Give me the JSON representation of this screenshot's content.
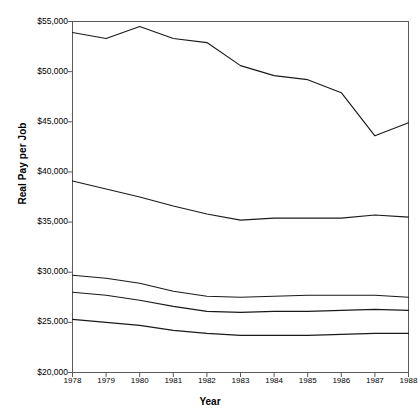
{
  "chart_data": {
    "type": "line",
    "title": "",
    "xlabel": "Year",
    "ylabel": "Real Pay per Job",
    "x": [
      1978,
      1979,
      1980,
      1981,
      1982,
      1983,
      1984,
      1985,
      1986,
      1987,
      1988
    ],
    "xtick_labels": [
      "1978",
      "1979",
      "1980",
      "1981",
      "1982",
      "1983",
      "1984",
      "1985",
      "1986",
      "1987",
      "1988"
    ],
    "ytick_labels": [
      "$55,000",
      "$50,000",
      "$45,000",
      "$40,000",
      "$35,000",
      "$30,000",
      "$25,000",
      "$20,000"
    ],
    "ytick_values": [
      55000,
      50000,
      45000,
      40000,
      35000,
      30000,
      25000,
      20000
    ],
    "ylim": [
      20000,
      55000
    ],
    "xlim": [
      1978,
      1988
    ],
    "grid": false,
    "legend": "inline-annotations",
    "line_color": "#1a1a1a",
    "series": [
      {
        "name": "Mining, Metal Smelting, and Timber",
        "change": "-$9,100",
        "values": [
          53900,
          53300,
          54500,
          53300,
          52900,
          50600,
          49600,
          49200,
          47900,
          43600,
          44900
        ]
      },
      {
        "name": "Goods Production",
        "change": "-$3,600",
        "values": [
          39100,
          38300,
          37500,
          36600,
          35800,
          35200,
          35400,
          35400,
          35400,
          35700,
          35500
        ]
      },
      {
        "name": "All Jobs",
        "change": "-$2,700",
        "values": [
          29700,
          29400,
          28900,
          28100,
          27600,
          27500,
          27600,
          27700,
          27700,
          27700,
          27500
        ]
      },
      {
        "name": "Non-Goods Production",
        "change": "-$1,900",
        "values": [
          28000,
          27700,
          27200,
          26600,
          26100,
          26000,
          26100,
          26100,
          26200,
          26300,
          26200
        ]
      },
      {
        "name": "Services",
        "change": "-$1,000",
        "values": [
          25300,
          25000,
          24700,
          24200,
          23900,
          23700,
          23700,
          23700,
          23800,
          23900,
          23900
        ]
      }
    ],
    "annotations": [
      {
        "text_line1": "Mining, Metal Smelting, and Timber:",
        "text_line2": "-$9,100",
        "x": 237,
        "y": 50
      },
      {
        "text_line1": "Goods Production: -$3,600",
        "text_line2": "",
        "x": 272,
        "y": 203
      },
      {
        "text_line1": "All Jobs: -$2,700",
        "text_line2": "",
        "x": 277,
        "y": 283
      },
      {
        "text_line1": "Non-Goods Production -$1,900",
        "text_line2": "",
        "x": 264,
        "y": 315
      },
      {
        "text_line1": "Services:  -$1,000",
        "text_line2": "",
        "x": 283,
        "y": 341
      }
    ]
  }
}
